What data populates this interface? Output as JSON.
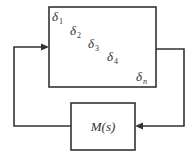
{
  "diagram": {
    "type": "feedback-loop",
    "blocks": [
      {
        "id": "delta",
        "kind": "uncertainty-block",
        "diagonal_entries": [
          {
            "symbol": "δ",
            "subscript": "1"
          },
          {
            "symbol": "δ",
            "subscript": "2"
          },
          {
            "symbol": "δ",
            "subscript": "3"
          },
          {
            "symbol": "δ",
            "subscript": "4"
          },
          {
            "symbol": "δ",
            "subscript": "n"
          }
        ]
      },
      {
        "id": "plant",
        "label": "M(s)"
      }
    ],
    "connections": [
      {
        "from": "delta",
        "to": "plant",
        "route": "right side, down, arrow into M(s) from right"
      },
      {
        "from": "plant",
        "to": "delta",
        "route": "left side, up, arrow into delta block from left"
      }
    ],
    "colors": {
      "line": "#333333",
      "background": "#ffffff"
    }
  }
}
